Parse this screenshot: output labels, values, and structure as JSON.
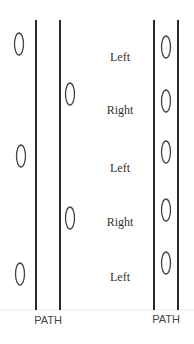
{
  "diagram": {
    "left_path": {
      "label": "PATH",
      "line_x": [
        36,
        60
      ],
      "ovals": [
        {
          "cx": 19,
          "cy": 44
        },
        {
          "cx": 70,
          "cy": 94
        },
        {
          "cx": 21,
          "cy": 156
        },
        {
          "cx": 70,
          "cy": 218
        },
        {
          "cx": 20,
          "cy": 274
        }
      ]
    },
    "right_path": {
      "label": "PATH",
      "line_x": [
        154,
        178
      ],
      "ovals": [
        {
          "cx": 166,
          "cy": 47
        },
        {
          "cx": 166,
          "cy": 101
        },
        {
          "cx": 166,
          "cy": 152
        },
        {
          "cx": 166,
          "cy": 210
        },
        {
          "cx": 166,
          "cy": 263
        }
      ]
    },
    "step_labels": [
      {
        "text": "Left",
        "x": 120,
        "y": 57
      },
      {
        "text": "Right",
        "x": 120,
        "y": 110
      },
      {
        "text": "Left",
        "x": 120,
        "y": 168
      },
      {
        "text": "Right",
        "x": 120,
        "y": 222
      },
      {
        "text": "Left",
        "x": 120,
        "y": 277
      }
    ],
    "colors": {
      "line": "#2b2b2b",
      "oval": "#444444",
      "ground": "#e6e6e6"
    }
  }
}
